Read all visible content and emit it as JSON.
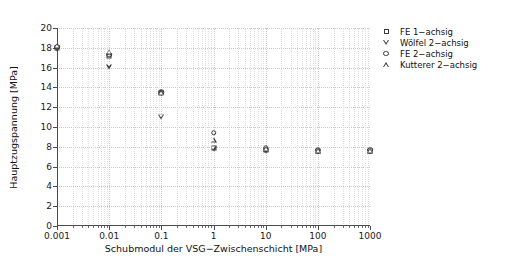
{
  "chart_data": {
    "type": "scatter",
    "title": "",
    "xlabel": "Schubmodul der VSG−Zwischenschicht [MPa]",
    "ylabel": "Hauptzugspannung [MPa]",
    "xscale": "log",
    "yscale": "linear",
    "xlim": [
      0.001,
      1000
    ],
    "ylim": [
      0,
      20
    ],
    "grid": true,
    "legend_position": "outside-top-right",
    "x_ticks": [
      "0.001",
      "0.01",
      "0.1",
      "1",
      "10",
      "100",
      "1000"
    ],
    "x_tick_values": [
      0.001,
      0.01,
      0.1,
      1,
      10,
      100,
      1000
    ],
    "y_ticks": [
      "0",
      "2",
      "4",
      "6",
      "8",
      "10",
      "12",
      "14",
      "16",
      "18",
      "20"
    ],
    "y_tick_values": [
      0,
      2,
      4,
      6,
      8,
      10,
      12,
      14,
      16,
      18,
      20
    ],
    "x": [
      0.001,
      0.01,
      0.1,
      1,
      10,
      100,
      1000
    ],
    "series": [
      {
        "name": "FE 1−achsig",
        "marker": "square",
        "values": [
          18.0,
          17.2,
          13.4,
          7.9,
          7.7,
          7.6,
          7.6
        ]
      },
      {
        "name": "Wölfel 2−achsig",
        "marker": "triangle-down",
        "values": [
          17.9,
          16.1,
          11.0,
          7.8,
          7.6,
          7.5,
          7.5
        ]
      },
      {
        "name": "FE 2−achsig",
        "marker": "circle",
        "values": [
          18.1,
          17.3,
          13.5,
          9.4,
          7.9,
          7.7,
          7.7
        ]
      },
      {
        "name": "Kutterer 2−achsig",
        "marker": "triangle-up",
        "values": [
          18.2,
          17.6,
          13.5,
          8.7,
          7.8,
          7.6,
          7.6
        ]
      }
    ]
  },
  "legend": {
    "entries": [
      {
        "label": "FE 1−achsig",
        "marker": "square"
      },
      {
        "label": "Wölfel 2−achsig",
        "marker": "triangle-down"
      },
      {
        "label": "FE 2−achsig",
        "marker": "circle"
      },
      {
        "label": "Kutterer 2−achsig",
        "marker": "triangle-up"
      }
    ]
  },
  "colors": {
    "marker": "#3a3a3a",
    "axis": "#4a4a4a",
    "grid": "#c9c9c9",
    "background": "#ffffff"
  }
}
